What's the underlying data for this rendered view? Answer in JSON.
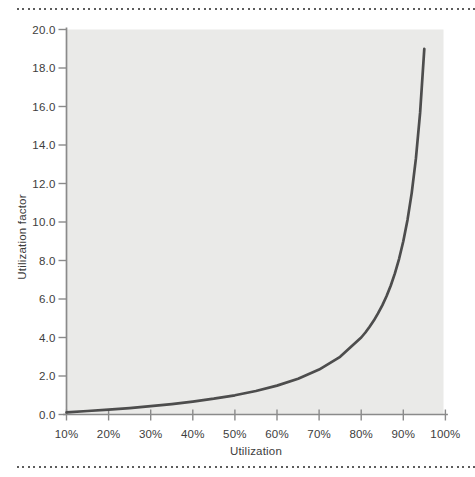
{
  "figure": {
    "top_rule_style": "dotted",
    "bottom_rule_style": "dotted"
  },
  "chart_data": {
    "type": "line",
    "title": "",
    "xlabel": "Utilization",
    "ylabel": "Utilization factor",
    "xlim": [
      10,
      100
    ],
    "ylim": [
      0,
      20
    ],
    "grid": false,
    "legend": "none",
    "x_tick_values": [
      10,
      20,
      30,
      40,
      50,
      60,
      70,
      80,
      90,
      100
    ],
    "x_tick_labels": [
      "10%",
      "20%",
      "30%",
      "40%",
      "50%",
      "60%",
      "70%",
      "80%",
      "90%",
      "100%"
    ],
    "y_tick_values": [
      0,
      2,
      4,
      6,
      8,
      10,
      12,
      14,
      16,
      18,
      20
    ],
    "y_tick_labels": [
      "0.0",
      "2.0",
      "4.0",
      "6.0",
      "8.0",
      "10.0",
      "12.0",
      "14.0",
      "16.0",
      "18.0",
      "20.0"
    ],
    "series": [
      {
        "name": "utilization factor curve",
        "x": [
          10,
          15,
          20,
          25,
          30,
          35,
          40,
          45,
          50,
          55,
          60,
          65,
          70,
          75,
          80,
          81,
          82,
          83,
          84,
          85,
          86,
          87,
          88,
          89,
          90,
          91,
          92,
          93,
          94,
          95
        ],
        "y": [
          0.11,
          0.18,
          0.25,
          0.33,
          0.43,
          0.54,
          0.67,
          0.82,
          1.0,
          1.22,
          1.5,
          1.86,
          2.33,
          3.0,
          4.0,
          4.26,
          4.56,
          4.88,
          5.25,
          5.67,
          6.14,
          6.69,
          7.33,
          8.09,
          9.0,
          10.11,
          11.5,
          13.29,
          15.67,
          19.0
        ]
      }
    ],
    "colors": {
      "curve": "#4d4d4d",
      "plot_background": "#eaeae8",
      "axis": "#8a8a8a",
      "tick_label": "#3d3d3d",
      "axis_title": "#3d3d3d",
      "dotted_rule": "#5c5c5c",
      "page_background": "#ffffff"
    }
  }
}
